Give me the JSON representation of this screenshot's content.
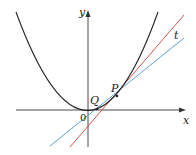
{
  "diagram": {
    "type": "tangent-secant-parabola",
    "labels": {
      "y_axis": "y",
      "x_axis": "x",
      "origin": "0",
      "point_p": "P",
      "point_q": "Q",
      "tangent_line": "t"
    },
    "colors": {
      "curve": "#222222",
      "axes": "#333333",
      "secant_line": "#5aa3d6",
      "tangent_line": "#d9534f",
      "background": "#ffffff"
    }
  }
}
